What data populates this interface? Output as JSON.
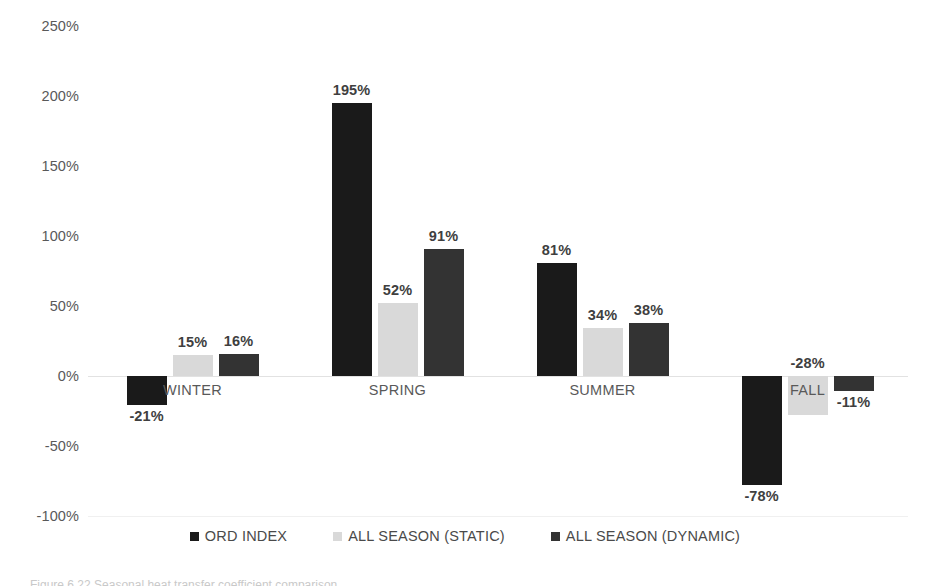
{
  "chart_data": {
    "type": "bar",
    "title": "",
    "xlabel": "",
    "ylabel": "",
    "categories": [
      "WINTER",
      "SPRING",
      "SUMMER",
      "FALL"
    ],
    "series": [
      {
        "name": "ORD INDEX",
        "color": "#1a1a1a",
        "values": [
          -21,
          195,
          81,
          -78
        ]
      },
      {
        "name": "ALL SEASON (STATIC)",
        "color": "#d9d9d9",
        "values": [
          15,
          52,
          34,
          -28
        ]
      },
      {
        "name": "ALL SEASON (DYNAMIC)",
        "color": "#333333",
        "values": [
          16,
          91,
          38,
          -11
        ]
      }
    ],
    "value_labels": [
      [
        "-21%",
        "15%",
        "16%"
      ],
      [
        "195%",
        "52%",
        "91%"
      ],
      [
        "81%",
        "34%",
        "38%"
      ],
      [
        "-78%",
        "-28%",
        "-11%"
      ]
    ],
    "ylim": [
      -100,
      250
    ],
    "ytick_step": 50,
    "ytick_labels": [
      "250%",
      "200%",
      "150%",
      "100%",
      "50%",
      "0%",
      "-50%",
      "-100%"
    ],
    "ytick_values": [
      250,
      200,
      150,
      100,
      50,
      0,
      -50,
      -100
    ],
    "grid": false,
    "zero_line": true,
    "legend_position": "bottom",
    "value_label_format": "percent"
  },
  "legend": {
    "items": [
      {
        "label": "ORD INDEX",
        "color": "#1a1a1a"
      },
      {
        "label": "ALL SEASON (STATIC)",
        "color": "#d9d9d9"
      },
      {
        "label": "ALL SEASON (DYNAMIC)",
        "color": "#333333"
      }
    ]
  },
  "caption": {
    "text": "Figure 6.22  Seasonal heat transfer coefficient comparison"
  }
}
